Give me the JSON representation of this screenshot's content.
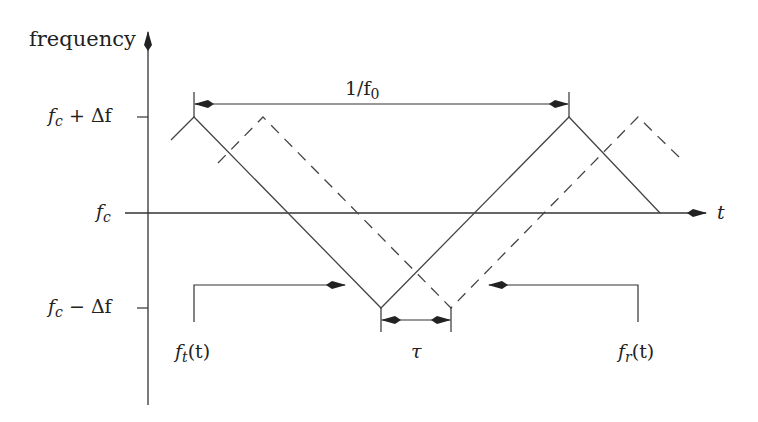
{
  "diagram": {
    "y_axis_label": "frequency",
    "x_axis_label": "t",
    "y_ticks": [
      {
        "label_main": "f",
        "label_sub": "c",
        "label_suffix": " + Δf",
        "level": "fc+Δf"
      },
      {
        "label_main": "f",
        "label_sub": "c",
        "label_suffix": "",
        "level": "fc"
      },
      {
        "label_main": "f",
        "label_sub": "c",
        "label_suffix": " − Δf",
        "level": "fc−Δf"
      }
    ],
    "period_label": "1/f",
    "period_sub": "0",
    "delay_label": "τ",
    "transmitted": {
      "label_main": "f",
      "label_sub": "t",
      "label_arg": "(t)",
      "style": "solid"
    },
    "received": {
      "label_main": "f",
      "label_sub": "r",
      "label_arg": "(t)",
      "style": "dashed"
    },
    "colors": {
      "line": "#333333",
      "text": "#222222",
      "background": "#ffffff"
    }
  }
}
